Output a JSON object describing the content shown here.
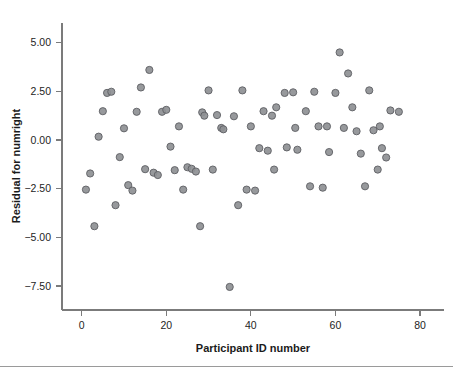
{
  "chart_data": {
    "type": "scatter",
    "title": "",
    "xlabel": "Participant ID number",
    "ylabel": "Residual for numright",
    "xlim": [
      -2,
      84
    ],
    "ylim": [
      -8.9,
      6.1
    ],
    "xticks": [
      0,
      20,
      40,
      60,
      80
    ],
    "xtick_labels": [
      "0",
      "20",
      "40",
      "60",
      "80"
    ],
    "yticks": [
      5.0,
      2.5,
      0.0,
      -2.5,
      -5.0,
      -7.5
    ],
    "ytick_labels": [
      "5.00",
      "2.50",
      "0.00",
      "-2.50",
      "-5.00",
      "-7.50"
    ],
    "grid": false,
    "legend": null,
    "marker": {
      "shape": "circle",
      "fill_color": "#8e9094",
      "edge_color": "#5d5f63",
      "radius_px": 3.6
    },
    "n_points": 95,
    "points": [
      {
        "x": 1,
        "y": -2.55
      },
      {
        "x": 2,
        "y": -1.72
      },
      {
        "x": 3,
        "y": -4.43
      },
      {
        "x": 4,
        "y": 0.17
      },
      {
        "x": 5,
        "y": 1.48
      },
      {
        "x": 6,
        "y": 2.42
      },
      {
        "x": 7,
        "y": 2.48
      },
      {
        "x": 8,
        "y": -3.35
      },
      {
        "x": 9,
        "y": -0.88
      },
      {
        "x": 10,
        "y": 0.6
      },
      {
        "x": 11,
        "y": -2.32
      },
      {
        "x": 12,
        "y": -2.6
      },
      {
        "x": 13,
        "y": 1.45
      },
      {
        "x": 14,
        "y": 2.7
      },
      {
        "x": 15,
        "y": -1.5
      },
      {
        "x": 16,
        "y": 3.6
      },
      {
        "x": 17,
        "y": -1.68
      },
      {
        "x": 18,
        "y": -1.8
      },
      {
        "x": 19,
        "y": 1.45
      },
      {
        "x": 20,
        "y": 1.55
      },
      {
        "x": 21,
        "y": -0.34
      },
      {
        "x": 22,
        "y": -1.55
      },
      {
        "x": 23,
        "y": 0.7
      },
      {
        "x": 24,
        "y": -2.55
      },
      {
        "x": 25,
        "y": -1.4
      },
      {
        "x": 26,
        "y": -1.48
      },
      {
        "x": 27,
        "y": -1.62
      },
      {
        "x": 28,
        "y": -4.43
      },
      {
        "x": 28.5,
        "y": 1.42
      },
      {
        "x": 29,
        "y": 1.25
      },
      {
        "x": 30,
        "y": 2.55
      },
      {
        "x": 31,
        "y": -1.52
      },
      {
        "x": 32,
        "y": 1.28
      },
      {
        "x": 33,
        "y": 0.62
      },
      {
        "x": 33.5,
        "y": 0.55
      },
      {
        "x": 35,
        "y": -7.55
      },
      {
        "x": 36,
        "y": 1.22
      },
      {
        "x": 37,
        "y": -3.35
      },
      {
        "x": 38,
        "y": 2.55
      },
      {
        "x": 39,
        "y": -2.55
      },
      {
        "x": 40,
        "y": 0.7
      },
      {
        "x": 41,
        "y": -2.6
      },
      {
        "x": 42,
        "y": -0.42
      },
      {
        "x": 43,
        "y": 1.48
      },
      {
        "x": 44,
        "y": -0.55
      },
      {
        "x": 45,
        "y": 1.25
      },
      {
        "x": 45.5,
        "y": -1.52
      },
      {
        "x": 46,
        "y": 1.68
      },
      {
        "x": 48,
        "y": 2.42
      },
      {
        "x": 48.5,
        "y": -0.38
      },
      {
        "x": 50,
        "y": 2.45
      },
      {
        "x": 50.5,
        "y": 0.62
      },
      {
        "x": 51,
        "y": -0.5
      },
      {
        "x": 53,
        "y": 1.48
      },
      {
        "x": 54,
        "y": -2.38
      },
      {
        "x": 55,
        "y": 2.48
      },
      {
        "x": 56,
        "y": 0.7
      },
      {
        "x": 57,
        "y": -2.45
      },
      {
        "x": 58,
        "y": 0.7
      },
      {
        "x": 58.5,
        "y": -0.62
      },
      {
        "x": 60,
        "y": 2.42
      },
      {
        "x": 61,
        "y": 4.5
      },
      {
        "x": 62,
        "y": 0.62
      },
      {
        "x": 63,
        "y": 3.42
      },
      {
        "x": 64,
        "y": 1.68
      },
      {
        "x": 65,
        "y": 0.45
      },
      {
        "x": 66,
        "y": -0.7
      },
      {
        "x": 67,
        "y": -2.38
      },
      {
        "x": 68,
        "y": 2.55
      },
      {
        "x": 69,
        "y": 0.5
      },
      {
        "x": 70,
        "y": -1.52
      },
      {
        "x": 70.5,
        "y": 0.7
      },
      {
        "x": 71,
        "y": -0.42
      },
      {
        "x": 72,
        "y": -0.9
      },
      {
        "x": 73,
        "y": 1.52
      },
      {
        "x": 75,
        "y": 1.45
      }
    ]
  },
  "axes": {
    "y_title": "Residual for numright",
    "x_title": "Participant ID number"
  }
}
